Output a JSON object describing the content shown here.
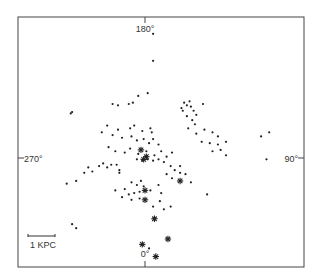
{
  "chart_data": {
    "type": "scatter",
    "title": "",
    "xlabel": "",
    "ylabel": "",
    "grid": false,
    "origin": "Sun",
    "axis_direction_labels": {
      "top": "180°",
      "bottom": "0°",
      "left": "270°",
      "right": "90°"
    },
    "scale_bar": {
      "label": "1 KPC",
      "length_kpc": 1
    },
    "xlim_kpc": [
      -4.7,
      5.9
    ],
    "ylim_kpc": [
      -4.0,
      5.2
    ],
    "series": [
      {
        "name": "dots",
        "marker": "dot",
        "points_kpc": [
          [
            0.3,
            4.6
          ],
          [
            0.3,
            3.6
          ],
          [
            -2.7,
            1.7
          ],
          [
            -2.75,
            1.65
          ],
          [
            -1.2,
            2.0
          ],
          [
            -1.0,
            1.95
          ],
          [
            -0.6,
            2.0
          ],
          [
            -0.45,
            2.05
          ],
          [
            -0.25,
            2.3
          ],
          [
            0.1,
            2.4
          ],
          [
            -1.4,
            1.2
          ],
          [
            -1.0,
            1.05
          ],
          [
            -0.55,
            1.1
          ],
          [
            -0.4,
            1.2
          ],
          [
            -0.1,
            1.0
          ],
          [
            0.2,
            1.1
          ],
          [
            0.25,
            0.95
          ],
          [
            -1.6,
            0.95
          ],
          [
            -1.2,
            0.85
          ],
          [
            -0.85,
            0.75
          ],
          [
            -0.5,
            0.8
          ],
          [
            -0.3,
            0.65
          ],
          [
            -0.05,
            0.7
          ],
          [
            0.15,
            0.55
          ],
          [
            0.3,
            0.7
          ],
          [
            0.5,
            0.5
          ],
          [
            -1.35,
            0.4
          ],
          [
            -1.1,
            0.25
          ],
          [
            -0.75,
            0.2
          ],
          [
            -0.55,
            0.35
          ],
          [
            -0.25,
            0.15
          ],
          [
            0.05,
            0.25
          ],
          [
            0.35,
            0.1
          ],
          [
            0.6,
            0.25
          ],
          [
            0.8,
            0.05
          ],
          [
            1.0,
            0.2
          ],
          [
            -0.3,
            -0.05
          ],
          [
            -0.1,
            -0.1
          ],
          [
            0.1,
            -0.05
          ],
          [
            0.3,
            -0.1
          ],
          [
            0.5,
            -0.05
          ],
          [
            0.7,
            -0.15
          ],
          [
            0.95,
            -0.3
          ],
          [
            1.1,
            -0.45
          ],
          [
            1.3,
            -0.55
          ],
          [
            1.5,
            -0.6
          ],
          [
            1.3,
            -0.3
          ],
          [
            0.8,
            -0.6
          ],
          [
            1.0,
            -0.75
          ],
          [
            1.7,
            -0.9
          ],
          [
            2.3,
            -1.35
          ],
          [
            1.35,
            1.85
          ],
          [
            1.45,
            2.05
          ],
          [
            1.55,
            1.95
          ],
          [
            1.4,
            1.75
          ],
          [
            1.65,
            2.1
          ],
          [
            1.7,
            1.9
          ],
          [
            1.8,
            1.75
          ],
          [
            1.9,
            1.6
          ],
          [
            2.15,
            2.0
          ],
          [
            1.55,
            1.55
          ],
          [
            1.75,
            1.4
          ],
          [
            1.85,
            1.25
          ],
          [
            1.6,
            1.1
          ],
          [
            1.9,
            0.9
          ],
          [
            2.2,
            1.05
          ],
          [
            2.5,
            0.95
          ],
          [
            2.7,
            0.8
          ],
          [
            2.1,
            0.6
          ],
          [
            2.4,
            0.55
          ],
          [
            2.7,
            0.5
          ],
          [
            3.0,
            0.6
          ],
          [
            2.5,
            0.25
          ],
          [
            2.8,
            0.3
          ],
          [
            3.0,
            0.1
          ],
          [
            4.3,
            0.8
          ],
          [
            4.6,
            0.95
          ],
          [
            4.5,
            -0.05
          ],
          [
            -2.9,
            -0.95
          ],
          [
            -2.55,
            -0.85
          ],
          [
            -2.25,
            -0.55
          ],
          [
            -2.1,
            -0.35
          ],
          [
            -1.95,
            -0.5
          ],
          [
            -1.7,
            -0.3
          ],
          [
            -1.55,
            -0.2
          ],
          [
            -1.4,
            -0.35
          ],
          [
            -1.25,
            -0.25
          ],
          [
            -1.05,
            -0.25
          ],
          [
            -0.95,
            -0.55
          ],
          [
            -0.95,
            -0.45
          ],
          [
            -0.5,
            -0.9
          ],
          [
            -0.3,
            -1.0
          ],
          [
            -0.15,
            -0.85
          ],
          [
            -0.05,
            -1.05
          ],
          [
            -0.2,
            -1.25
          ],
          [
            -0.4,
            -1.3
          ],
          [
            -0.6,
            -1.35
          ],
          [
            -0.5,
            -1.55
          ],
          [
            -0.2,
            -1.5
          ],
          [
            0.2,
            -1.2
          ],
          [
            0.5,
            -1.0
          ],
          [
            0.6,
            -1.3
          ],
          [
            0.55,
            -1.6
          ],
          [
            0.3,
            -1.8
          ],
          [
            0.7,
            -1.9
          ],
          [
            0.95,
            -1.8
          ],
          [
            -0.85,
            -1.45
          ],
          [
            -0.75,
            -1.15
          ],
          [
            -1.1,
            -1.2
          ],
          [
            -2.7,
            -2.45
          ],
          [
            -2.55,
            -2.6
          ],
          [
            0.15,
            -3.35
          ]
        ]
      },
      {
        "name": "stars",
        "marker": "asterisk",
        "points_kpc": [
          [
            -0.15,
            0.3
          ],
          [
            0.05,
            0.05
          ],
          [
            -0.05,
            -0.05
          ],
          [
            0.0,
            -1.2
          ],
          [
            0.0,
            -1.55
          ],
          [
            0.35,
            -2.25
          ],
          [
            1.3,
            -0.85
          ],
          [
            0.85,
            -3.0
          ],
          [
            -0.1,
            -3.2
          ],
          [
            0.4,
            -3.65
          ]
        ]
      }
    ]
  }
}
